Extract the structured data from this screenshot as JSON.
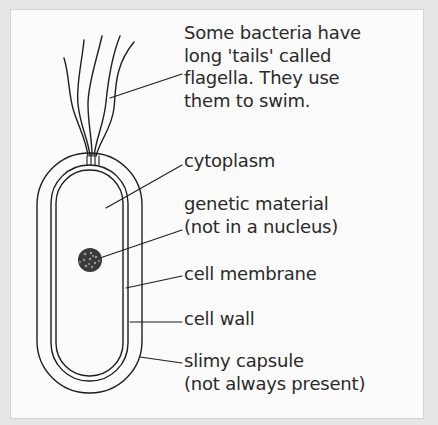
{
  "diagram": {
    "labels": [
      {
        "id": "flagella",
        "text": "Some bacteria have\nlong 'tails' called\nflagella. They use\nthem to swim."
      },
      {
        "id": "cytoplasm",
        "text": "cytoplasm"
      },
      {
        "id": "genetic-material",
        "text": "genetic material\n(not in a nucleus)"
      },
      {
        "id": "cell-membrane",
        "text": "cell membrane"
      },
      {
        "id": "cell-wall",
        "text": "cell wall"
      },
      {
        "id": "slimy-capsule",
        "text": "slimy capsule\n(not always present)"
      }
    ],
    "colors": {
      "line": "#1e1e1e",
      "text": "#2a2a2a",
      "panel": "#fbfbfb",
      "frame": "#e6e6e6",
      "nucleoid": "#3a3a3a"
    }
  }
}
